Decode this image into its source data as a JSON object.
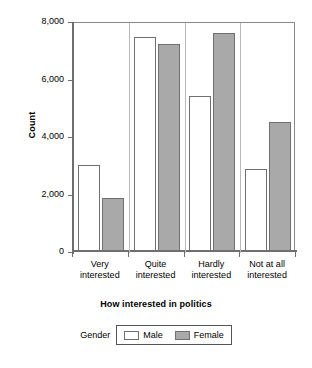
{
  "chart_data": {
    "type": "bar",
    "title": "",
    "xlabel": "How interested in politics",
    "ylabel": "Count",
    "categories": [
      "Very interested",
      "Quite interested",
      "Hardly interested",
      "Not at all interested"
    ],
    "category_lines": [
      [
        "Very",
        "interested"
      ],
      [
        "Quite",
        "interested"
      ],
      [
        "Hardly",
        "interested"
      ],
      [
        "Not at all",
        "interested"
      ]
    ],
    "series": [
      {
        "name": "Male",
        "values": [
          3000,
          7450,
          5400,
          2850
        ],
        "color": "#ffffff"
      },
      {
        "name": "Female",
        "values": [
          1850,
          7200,
          7600,
          4500
        ],
        "color": "#a9a9a9"
      }
    ],
    "ylim": [
      0,
      8000
    ],
    "yticks": [
      0,
      2000,
      4000,
      6000,
      8000
    ],
    "ytick_labels": [
      "0",
      "2,000",
      "4,000",
      "6,000",
      "8,000"
    ],
    "grid": false,
    "legend_position": "bottom",
    "legend_title": "Gender"
  },
  "axes": {
    "y_title": "Count",
    "x_title": "How interested in politics"
  },
  "legend": {
    "title": "Gender",
    "items": [
      {
        "label": "Male",
        "swatch": "white-square-icon"
      },
      {
        "label": "Female",
        "swatch": "gray-square-icon"
      }
    ]
  }
}
